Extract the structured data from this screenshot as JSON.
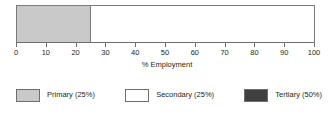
{
  "chart_data": {
    "type": "bar",
    "orientation": "horizontal",
    "stacked": true,
    "title": "",
    "xlabel": "% Employment",
    "ylabel": "",
    "xlim": [
      0,
      100
    ],
    "grid": false,
    "legend_position": "bottom",
    "categories": [
      ""
    ],
    "tick_labels": [
      "0",
      "10",
      "20",
      "30",
      "40",
      "50",
      "60",
      "70",
      "80",
      "90",
      "100"
    ],
    "tick_values": [
      0,
      10,
      20,
      30,
      40,
      50,
      60,
      70,
      80,
      90,
      100
    ],
    "series": [
      {
        "name": "Primary",
        "values": [
          25
        ],
        "percent_label": "25%",
        "color": "#c9c9c9",
        "start": 0,
        "end": 25
      },
      {
        "name": "Secondary",
        "values": [
          25
        ],
        "percent_label": "25%",
        "color": "#ffffff",
        "start": 25,
        "end": 100
      },
      {
        "name": "Tertiary",
        "values": [
          50
        ],
        "percent_label": "50%",
        "color": "#404040",
        "start": 100,
        "end": 100
      }
    ],
    "legend": [
      {
        "label": "Primary (25%)",
        "color": "#c9c9c9"
      },
      {
        "label": "Secondary (25%)",
        "color": "#ffffff"
      },
      {
        "label": "Tertiary (50%)",
        "color": "#404040"
      }
    ],
    "drawn_segments": [
      {
        "name": "Primary",
        "from": 0,
        "to": 25,
        "color": "#c9c9c9"
      },
      {
        "name": "Secondary",
        "from": 25,
        "to": 100,
        "color": "#ffffff"
      }
    ]
  },
  "axis": {
    "label": "% Employment",
    "ticks": [
      {
        "value": 0,
        "label": "0"
      },
      {
        "value": 10,
        "label": "10"
      },
      {
        "value": 20,
        "label": "20"
      },
      {
        "value": 30,
        "label": "30"
      },
      {
        "value": 40,
        "label": "40"
      },
      {
        "value": 50,
        "label": "50"
      },
      {
        "value": 60,
        "label": "60"
      },
      {
        "value": 70,
        "label": "70"
      },
      {
        "value": 80,
        "label": "80"
      },
      {
        "value": 90,
        "label": "90"
      },
      {
        "value": 100,
        "label": "100"
      }
    ]
  },
  "legend": {
    "items": [
      {
        "label": "Primary (25%)",
        "color": "#c9c9c9"
      },
      {
        "label": "Secondary (25%)",
        "color": "#ffffff"
      },
      {
        "label": "Tertiary (50%)",
        "color": "#404040"
      }
    ]
  },
  "colors": {
    "primary": "#c9c9c9",
    "secondary": "#ffffff",
    "tertiary": "#404040",
    "outline": "#6e6e6e",
    "text": "#231f20"
  }
}
